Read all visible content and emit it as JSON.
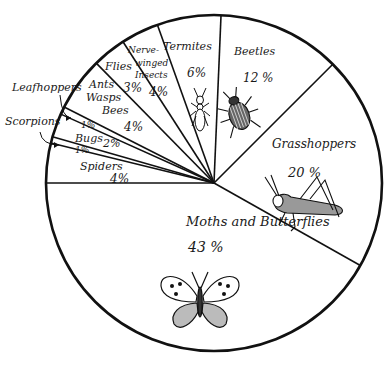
{
  "chart_data": {
    "type": "pie",
    "title": "",
    "center": [
      214,
      183
    ],
    "radius": 168,
    "colors": {
      "line": "#111111",
      "fill": "#ffffff",
      "text": "#1a1a1a"
    },
    "slices": [
      {
        "label": "Moths and Butterflies",
        "value": 43,
        "text": "43 %",
        "start": 29.4,
        "end": 180,
        "lx": 186,
        "ly": 226,
        "vx": 188,
        "vy": 252,
        "fs": 13,
        "vfs": 14,
        "icon": "butterfly"
      },
      {
        "label": "Spiders",
        "value": 4,
        "text": "4%",
        "start": 180,
        "end": 193.8,
        "lx": 80,
        "ly": 170,
        "vx": 110,
        "vy": 183,
        "fs": 11,
        "vfs": 12
      },
      {
        "label": "Scorpions",
        "value": 1,
        "text": "1%",
        "start": 193.8,
        "end": 196,
        "lx": 0,
        "ly": 0,
        "vx": 75,
        "vy": 153,
        "fs": 0,
        "vfs": 9,
        "external": true
      },
      {
        "label": "Bugs",
        "value": 2,
        "text": "2%",
        "start": 196,
        "end": 204.2,
        "lx": 75,
        "ly": 142,
        "vx": 103,
        "vy": 147,
        "fs": 11,
        "vfs": 11
      },
      {
        "label": "Leafhoppers",
        "value": 1,
        "text": "1%",
        "start": 204.2,
        "end": 206.9,
        "lx": 0,
        "ly": 0,
        "vx": 81,
        "vy": 128,
        "fs": 0,
        "vfs": 9,
        "external": true
      },
      {
        "label": "Ants Wasps Bees",
        "value": 4,
        "text": "4%",
        "start": 206.9,
        "end": 225.5,
        "lines": [
          "Ants",
          "Wasps",
          "Bees"
        ],
        "lpos": [
          [
            89,
            88
          ],
          [
            86,
            101
          ],
          [
            102,
            114
          ]
        ],
        "vx": 124,
        "vy": 131,
        "fs": 11,
        "vfs": 12
      },
      {
        "label": "Flies",
        "value": 3,
        "text": "3%",
        "start": 225.5,
        "end": 237.2,
        "lx": 105,
        "ly": 70,
        "vx": 123,
        "vy": 92,
        "fs": 11,
        "vfs": 12
      },
      {
        "label": "Nerve-winged Insects",
        "value": 4,
        "text": "4%",
        "start": 237.2,
        "end": 250.3,
        "lines": [
          "Nerve-",
          "winged",
          "Insects"
        ],
        "lpos": [
          [
            128,
            53
          ],
          [
            135,
            66
          ],
          [
            135,
            78
          ]
        ],
        "vx": 149,
        "vy": 96,
        "fs": 9,
        "vfs": 12
      },
      {
        "label": "Termites",
        "value": 6,
        "text": "6%",
        "start": 250.3,
        "end": 272.4,
        "lx": 163,
        "ly": 50,
        "vx": 187,
        "vy": 77,
        "fs": 11,
        "vfs": 12,
        "icon": "termite"
      },
      {
        "label": "Beetles",
        "value": 12,
        "text": "12 %",
        "start": 272.4,
        "end": 315,
        "lx": 234,
        "ly": 55,
        "vx": 243,
        "vy": 82,
        "fs": 11,
        "vfs": 12,
        "icon": "beetle"
      },
      {
        "label": "Grasshoppers",
        "value": 20,
        "text": "20 %",
        "start": 315,
        "end": 389.4,
        "lx": 272,
        "ly": 148,
        "vx": 288,
        "vy": 177,
        "fs": 12,
        "vfs": 13,
        "icon": "grasshopper"
      }
    ],
    "external_labels": [
      {
        "text": "Leafhoppers",
        "x": 12,
        "y": 91,
        "arrow_from": [
          60,
          95
        ],
        "arrow_to": [
          71,
          118
        ]
      },
      {
        "text": "Scorpions",
        "x": 5,
        "y": 125,
        "arrow_from": [
          40,
          132
        ],
        "arrow_to": [
          59,
          145
        ]
      }
    ]
  }
}
